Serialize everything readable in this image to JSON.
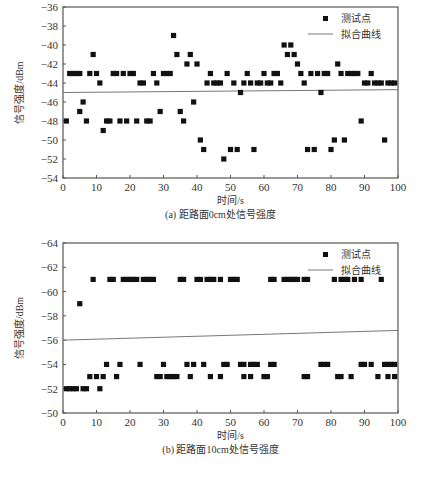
{
  "chart_data": [
    {
      "type": "scatter",
      "title": "(a) 距路面0cm处信号强度",
      "xlabel": "时间/s",
      "ylabel": "信号强度/dBm",
      "xlim": [
        0,
        100
      ],
      "ylim": [
        -54,
        -36
      ],
      "y_inverted": false,
      "xticks": [
        0,
        10,
        20,
        30,
        40,
        50,
        60,
        70,
        80,
        90,
        100
      ],
      "yticks": [
        -36,
        -38,
        -40,
        -42,
        -44,
        -46,
        -48,
        -50,
        -52,
        -54
      ],
      "grid": false,
      "legend": {
        "position": "upper right",
        "entries": [
          "测试点",
          "拟合曲线"
        ]
      },
      "series": [
        {
          "name": "测试点",
          "kind": "scatter",
          "x": [
            1,
            2,
            3,
            4,
            5,
            5,
            6,
            7,
            8,
            9,
            10,
            11,
            12,
            13,
            14,
            15,
            16,
            17,
            18,
            19,
            20,
            21,
            22,
            23,
            24,
            25,
            26,
            27,
            28,
            29,
            30,
            31,
            32,
            33,
            34,
            35,
            36,
            37,
            38,
            39,
            40,
            41,
            42,
            43,
            44,
            45,
            46,
            47,
            48,
            49,
            50,
            51,
            52,
            53,
            54,
            55,
            56,
            57,
            58,
            59,
            60,
            61,
            62,
            63,
            64,
            65,
            66,
            67,
            68,
            69,
            70,
            71,
            72,
            73,
            74,
            75,
            76,
            77,
            78,
            79,
            80,
            81,
            82,
            83,
            84,
            85,
            86,
            87,
            88,
            89,
            90,
            91,
            92,
            93,
            94,
            95,
            96,
            97,
            98,
            99
          ],
          "y": [
            -48,
            -43,
            -43,
            -43,
            -43,
            -47,
            -46,
            -48,
            -43,
            -41,
            -43,
            -44,
            -49,
            -48,
            -48,
            -43,
            -43,
            -48,
            -43,
            -48,
            -43,
            -43,
            -48,
            -44,
            -44,
            -48,
            -48,
            -43,
            -44,
            -47,
            -43,
            -43,
            -43,
            -39,
            -41,
            -47,
            -48,
            -42,
            -41,
            -46,
            -42,
            -50,
            -51,
            -44,
            -43,
            -44,
            -44,
            -44,
            -52,
            -43,
            -51,
            -44,
            -51,
            -45,
            -44,
            -43,
            -44,
            -51,
            -44,
            -44,
            -43,
            -44,
            -44,
            -43,
            -43,
            -44,
            -40,
            -41,
            -40,
            -41,
            -42,
            -43,
            -44,
            -51,
            -43,
            -51,
            -43,
            -45,
            -43,
            -43,
            -51,
            -50,
            -42,
            -43,
            -50,
            -43,
            -43,
            -43,
            -43,
            -48,
            -44,
            -44,
            -43,
            -44,
            -44,
            -44,
            -50,
            -44,
            -44,
            -44
          ]
        },
        {
          "name": "拟合曲线",
          "kind": "line",
          "x": [
            0,
            100
          ],
          "y": [
            -45.0,
            -44.7
          ]
        }
      ]
    },
    {
      "type": "scatter",
      "title": "(b) 距路面10cm处信号强度",
      "xlabel": "时间/s",
      "ylabel": "信号强度/dBm",
      "xlim": [
        0,
        100
      ],
      "ylim": [
        -50,
        -64
      ],
      "y_inverted": true,
      "xticks": [
        0,
        10,
        20,
        30,
        40,
        50,
        60,
        70,
        80,
        90,
        100
      ],
      "yticks": [
        -64,
        -62,
        -60,
        -58,
        -56,
        -54,
        -52,
        -50
      ],
      "grid": false,
      "legend": {
        "position": "upper right",
        "entries": [
          "测试点",
          "拟合曲线"
        ]
      },
      "series": [
        {
          "name": "测试点",
          "kind": "scatter",
          "x": [
            1,
            2,
            3,
            4,
            5,
            6,
            7,
            8,
            9,
            10,
            11,
            12,
            13,
            14,
            15,
            16,
            17,
            18,
            19,
            20,
            21,
            22,
            23,
            24,
            25,
            26,
            27,
            28,
            29,
            30,
            31,
            32,
            33,
            34,
            35,
            36,
            37,
            38,
            39,
            40,
            41,
            42,
            43,
            44,
            44,
            45,
            47,
            47,
            48,
            49,
            50,
            51,
            52,
            53,
            54,
            54,
            56,
            56,
            57,
            58,
            60,
            61,
            62,
            62,
            63,
            63,
            66,
            67,
            68,
            69,
            70,
            72,
            72,
            73,
            73,
            77,
            78,
            79,
            81,
            82,
            83,
            83,
            84,
            85,
            86,
            87,
            89,
            89,
            90,
            92,
            94,
            95,
            96,
            97,
            97,
            98,
            99,
            99
          ],
          "y": [
            -52,
            -52,
            -52,
            -52,
            -59,
            -52,
            -52,
            -53,
            -61,
            -53,
            -52,
            -53,
            -54,
            -61,
            -61,
            -53,
            -54,
            -61,
            -61,
            -61,
            -61,
            -61,
            -54,
            -61,
            -61,
            -61,
            -61,
            -53,
            -53,
            -54,
            -53,
            -53,
            -53,
            -53,
            -61,
            -61,
            -54,
            -53,
            -54,
            -61,
            -61,
            -54,
            -61,
            -53,
            -61,
            -61,
            -61,
            -53,
            -54,
            -54,
            -61,
            -61,
            -61,
            -54,
            -54,
            -53,
            -54,
            -53,
            -54,
            -54,
            -53,
            -53,
            -61,
            -54,
            -61,
            -54,
            -61,
            -61,
            -61,
            -61,
            -61,
            -61,
            -53,
            -61,
            -53,
            -54,
            -54,
            -54,
            -61,
            -53,
            -61,
            -53,
            -61,
            -61,
            -53,
            -61,
            -54,
            -61,
            -54,
            -54,
            -53,
            -61,
            -54,
            -54,
            -53,
            -54,
            -54,
            -53
          ]
        },
        {
          "name": "拟合曲线",
          "kind": "line",
          "x": [
            0,
            100
          ],
          "y": [
            -56.0,
            -56.8
          ]
        }
      ]
    }
  ]
}
